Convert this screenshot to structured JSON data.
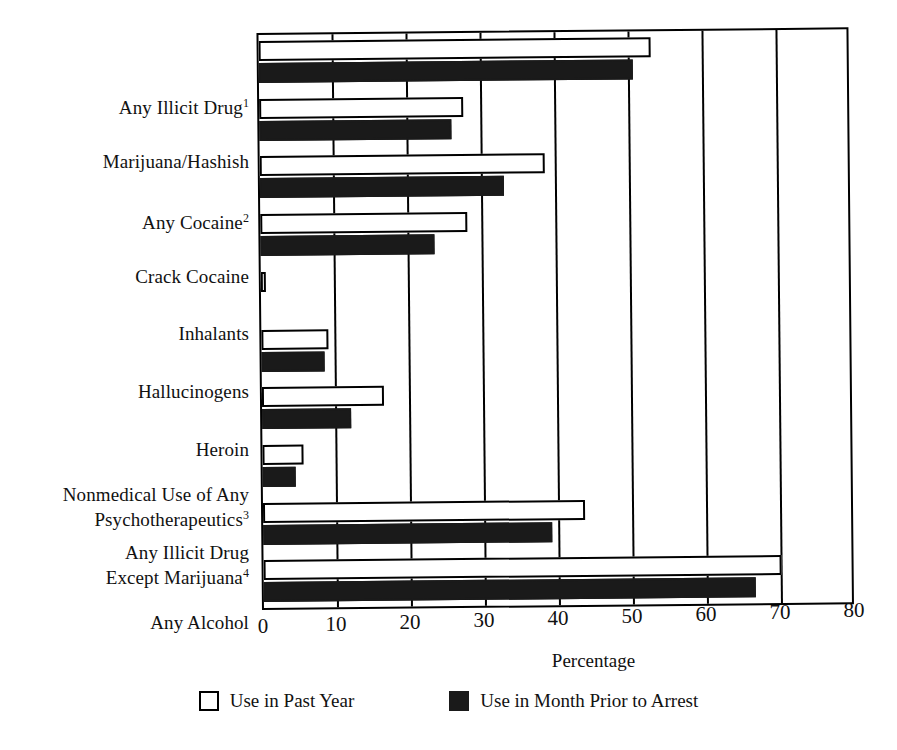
{
  "chart_data": {
    "type": "bar",
    "orientation": "horizontal",
    "title": "",
    "xlabel": "Percentage",
    "ylabel": "",
    "xlim": [
      0,
      80
    ],
    "xticks": [
      0,
      10,
      20,
      30,
      40,
      50,
      60,
      70,
      80
    ],
    "grid": true,
    "legend_position": "bottom",
    "categories": [
      "Any Illicit Drug¹",
      "Marijuana/Hashish",
      "Any Cocaine²",
      "Crack Cocaine",
      "Inhalants",
      "Hallucinogens",
      "Heroin",
      "Nonmedical Use of Any\nPsychotherapeutics³",
      "Any Illicit Drug\nExcept Marijuana⁴",
      "Any Alcohol"
    ],
    "series": [
      {
        "name": "Use in Past Year",
        "color": "#ffffff",
        "values": [
          53.0,
          27.5,
          38.5,
          28.0,
          0.4,
          9.0,
          16.5,
          5.5,
          43.5,
          70.0
        ]
      },
      {
        "name": "Use in Month Prior to Arrest",
        "color": "#1a1a1a",
        "values": [
          50.5,
          26.0,
          33.0,
          23.5,
          0.0,
          8.5,
          12.0,
          4.5,
          39.0,
          66.5
        ]
      }
    ],
    "annotations": [
      {
        "text": "*",
        "category": "Inhalants",
        "note": "low-precision estimate marker"
      }
    ]
  },
  "legend": {
    "items": [
      {
        "label": "Use in Past Year",
        "swatch": "open"
      },
      {
        "label": "Use in Month Prior to Arrest",
        "swatch": "filled"
      }
    ]
  },
  "axis": {
    "x_title": "Percentage",
    "tick_labels": [
      "0",
      "10",
      "20",
      "30",
      "40",
      "50",
      "60",
      "70",
      "80"
    ]
  },
  "colors": {
    "bar_open": "#ffffff",
    "bar_filled": "#1a1a1a",
    "axis": "#000000",
    "text": "#111111"
  }
}
